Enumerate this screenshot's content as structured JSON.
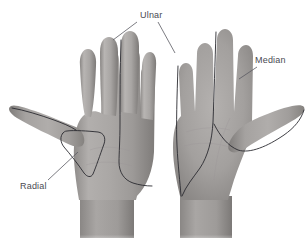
{
  "figure": {
    "background_color": "#ffffff",
    "width": 307,
    "height": 249
  },
  "labels": [
    {
      "id": "ulnar",
      "text": "Ulnar",
      "x": 140,
      "y": 18,
      "color": "#4a4a52"
    },
    {
      "id": "median",
      "text": "Median",
      "x": 255,
      "y": 63,
      "color": "#4a4a52"
    },
    {
      "id": "radial",
      "text": "Radial",
      "x": 20,
      "y": 189,
      "color": "#4a4a52"
    }
  ],
  "leader_lines": [
    {
      "id": "ulnar-to-dorsal-hand",
      "from_label": "Ulnar",
      "points": "137,22 113,40"
    },
    {
      "id": "ulnar-to-palmar-hand",
      "from_label": "Ulnar",
      "points": "158,22 175,53"
    },
    {
      "id": "median-to-palmar-hand",
      "from_label": "Median",
      "points": "257,67 239,79"
    },
    {
      "id": "radial-to-dorsal-hand",
      "from_label": "Radial",
      "points": "48,180 78,152"
    }
  ],
  "hands": [
    {
      "id": "left-hand-dorsal",
      "view": "dorsal",
      "skin_color": "#a9a6a4",
      "territories": [
        {
          "nerve": "Radial",
          "region": "dorsal thumb web / first dorsal interosseous"
        },
        {
          "nerve": "Ulnar",
          "region": "ulnar border, little finger and ulnar half of ring finger"
        }
      ]
    },
    {
      "id": "right-hand-palmar",
      "view": "palmar",
      "skin_color": "#a9a6a4",
      "territories": [
        {
          "nerve": "Median",
          "region": "radial palm, thumb, index, middle and radial half of ring finger"
        },
        {
          "nerve": "Ulnar",
          "region": "ulnar palm, little finger and ulnar half of ring finger"
        }
      ]
    }
  ],
  "colors": {
    "outline": "#2a2a30",
    "leader": "#5a5a62",
    "label_text": "#4a4a52",
    "skin_light": "#c4c1bf",
    "skin_mid": "#a9a6a4",
    "skin_dark": "#8d8a88",
    "skin_shadow": "#74716f"
  }
}
